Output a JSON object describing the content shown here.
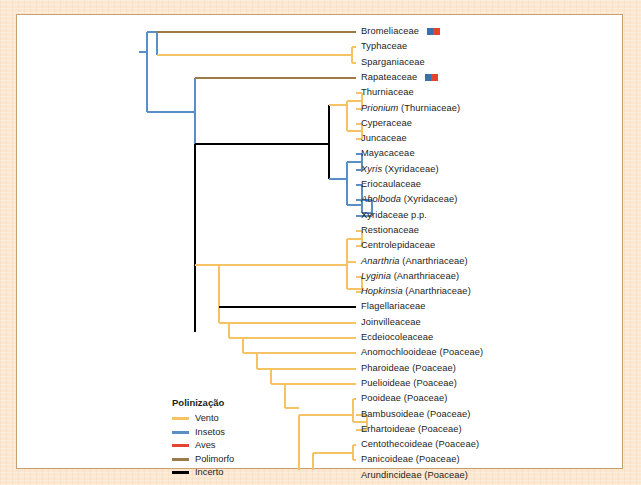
{
  "figure": {
    "kind": "phylogenetic-cladogram",
    "panel_background": "#ffffff",
    "page_background": "#fbe6cf",
    "border_color": "#c8a173"
  },
  "legend": {
    "title": "Polinização",
    "items": [
      {
        "label": "Vento",
        "color": "#f5c264"
      },
      {
        "label": "Insetos",
        "color": "#5b8ec4"
      },
      {
        "label": "Aves",
        "color": "#e1452f"
      },
      {
        "label": "Polimorfo",
        "color": "#9c7b4a"
      },
      {
        "label": "Incerto",
        "color": "#000000"
      }
    ]
  },
  "colors": {
    "wind": "#f5c264",
    "insect": "#5b8ec4",
    "bird": "#e1452f",
    "polymorph": "#9c7b4a",
    "unknown": "#000000"
  },
  "chart_data": {
    "type": "tree",
    "title": "Polinização",
    "leaf_count": 30,
    "leaves": [
      {
        "i": 0,
        "name": "Bromeliaceae",
        "italic": "",
        "rest": "Bromeliaceae",
        "branch_color": "polymorph",
        "badge": "blue-red"
      },
      {
        "i": 1,
        "name": "Typhaceae",
        "italic": "",
        "rest": "Typhaceae",
        "branch_color": "wind",
        "badge": ""
      },
      {
        "i": 2,
        "name": "Sparganiaceae",
        "italic": "",
        "rest": "Sparganiaceae",
        "branch_color": "wind",
        "badge": ""
      },
      {
        "i": 3,
        "name": "Rapateaceae",
        "italic": "",
        "rest": "Rapateaceae",
        "branch_color": "polymorph",
        "badge": "blue-red"
      },
      {
        "i": 4,
        "name": "Thurniaceae",
        "italic": "",
        "rest": "Thurniaceae",
        "branch_color": "wind",
        "badge": ""
      },
      {
        "i": 5,
        "name": "Prionium (Thurniaceae)",
        "italic": "Prionium",
        "rest": " (Thurniaceae)",
        "branch_color": "wind",
        "badge": ""
      },
      {
        "i": 6,
        "name": "Cyperaceae",
        "italic": "",
        "rest": "Cyperaceae",
        "branch_color": "wind",
        "badge": ""
      },
      {
        "i": 7,
        "name": "Juncaceae",
        "italic": "",
        "rest": "Juncaceae",
        "branch_color": "wind",
        "badge": ""
      },
      {
        "i": 8,
        "name": "Mayacaceae",
        "italic": "",
        "rest": "Mayacaceae",
        "branch_color": "insect",
        "badge": ""
      },
      {
        "i": 9,
        "name": "Xyris (Xyridaceae)",
        "italic": "Xyris",
        "rest": " (Xyridaceae)",
        "branch_color": "insect",
        "badge": ""
      },
      {
        "i": 10,
        "name": "Eriocaulaceae",
        "italic": "",
        "rest": "Eriocaulaceae",
        "branch_color": "insect",
        "badge": ""
      },
      {
        "i": 11,
        "name": "Abolboda (Xyridaceae)",
        "italic": "Abolboda",
        "rest": " (Xyridaceae)",
        "branch_color": "insect",
        "badge": ""
      },
      {
        "i": 12,
        "name": "Xyridaceae p.p.",
        "italic": "",
        "rest": "Xyridaceae p.p.",
        "branch_color": "insect",
        "badge": ""
      },
      {
        "i": 13,
        "name": "Restionaceae",
        "italic": "",
        "rest": "Restionaceae",
        "branch_color": "wind",
        "badge": ""
      },
      {
        "i": 14,
        "name": "Centrolepidaceae",
        "italic": "",
        "rest": "Centrolepidaceae",
        "branch_color": "wind",
        "badge": ""
      },
      {
        "i": 15,
        "name": "Anarthria (Anarthriaceae)",
        "italic": "Anarthria",
        "rest": " (Anarthriaceae)",
        "branch_color": "wind",
        "badge": ""
      },
      {
        "i": 16,
        "name": "Lyginia (Anarthriaceae)",
        "italic": "Lyginia",
        "rest": " (Anarthriaceae)",
        "branch_color": "wind",
        "badge": ""
      },
      {
        "i": 17,
        "name": "Hopkinsia (Anarthriaceae)",
        "italic": "Hopkinsia",
        "rest": " (Anarthriaceae)",
        "branch_color": "wind",
        "badge": ""
      },
      {
        "i": 18,
        "name": "Flagellariaceae",
        "italic": "",
        "rest": "Flagellariaceae",
        "branch_color": "unknown",
        "badge": ""
      },
      {
        "i": 19,
        "name": "Joinvilleaceae",
        "italic": "",
        "rest": "Joinvilleaceae",
        "branch_color": "wind",
        "badge": ""
      },
      {
        "i": 20,
        "name": "Ecdeiocoleaceae",
        "italic": "",
        "rest": "Ecdeiocoleaceae",
        "branch_color": "wind",
        "badge": ""
      },
      {
        "i": 21,
        "name": "Anomochlooideae (Poaceae)",
        "italic": "",
        "rest": "Anomochlooideae (Poaceae)",
        "branch_color": "wind",
        "badge": ""
      },
      {
        "i": 22,
        "name": "Pharoideae (Poaceae)",
        "italic": "",
        "rest": "Pharoideae (Poaceae)",
        "branch_color": "wind",
        "badge": ""
      },
      {
        "i": 23,
        "name": "Puelioideae (Poaceae)",
        "italic": "",
        "rest": "Puelioideae (Poaceae)",
        "branch_color": "wind",
        "badge": ""
      },
      {
        "i": 24,
        "name": "Pooideae (Poaceae)",
        "italic": "",
        "rest": "Pooideae (Poaceae)",
        "branch_color": "wind",
        "badge": ""
      },
      {
        "i": 25,
        "name": "Bambusoideae (Poaceae)",
        "italic": "",
        "rest": "Bambusoideae (Poaceae)",
        "branch_color": "wind",
        "badge": ""
      },
      {
        "i": 26,
        "name": "Erhartoideae (Poaceae)",
        "italic": "",
        "rest": "Erhartoideae (Poaceae)",
        "branch_color": "wind",
        "badge": ""
      },
      {
        "i": 27,
        "name": "Centothecoideae (Poaceae)",
        "italic": "",
        "rest": "Centothecoideae (Poaceae)",
        "branch_color": "wind",
        "badge": ""
      },
      {
        "i": 28,
        "name": "Panicoideae (Poaceae)",
        "italic": "",
        "rest": "Panicoideae (Poaceae)",
        "branch_color": "wind",
        "badge": ""
      },
      {
        "i": 29,
        "name": "Arundincideae (Poaceae)",
        "italic": "",
        "rest": "Arundincideae (Poaceae)",
        "branch_color": "wind",
        "badge": ""
      },
      {
        "i": 30,
        "name": "Chloridoideae (Poaceae)",
        "italic": "",
        "rest": "Chloridoideae (Poaceae)",
        "branch_color": "wind",
        "badge": ""
      },
      {
        "i": 31,
        "name": "Aristidoideae (Poaceae)",
        "italic": "",
        "rest": "Aristidoideae (Poaceae)",
        "branch_color": "wind",
        "badge": ""
      },
      {
        "i": 32,
        "name": "Danthonioideae (Poaceae)",
        "italic": "",
        "rest": "Danthonioideae (Poaceae)",
        "branch_color": "wind",
        "badge": ""
      }
    ],
    "layout": {
      "first_leaf_y": 31,
      "leaf_spacing": 15.3,
      "tip_x": 355,
      "label_x": 360,
      "root_x": 138
    },
    "edges": [
      {
        "from": "root",
        "to": "bromeliad-clade",
        "color": "insect"
      },
      {
        "from": "root",
        "to": "backbone",
        "color": "insect"
      },
      {
        "from": "backbone",
        "to": "rapateaceae",
        "color": "polymorph"
      },
      {
        "from": "backbone",
        "to": "core-clade",
        "color": "unknown"
      },
      {
        "from": "core-clade",
        "to": "cyperid",
        "color": "unknown"
      },
      {
        "from": "core-clade",
        "to": "xyrid",
        "color": "insect"
      },
      {
        "from": "core-clade",
        "to": "graminid",
        "color": "wind"
      }
    ]
  }
}
